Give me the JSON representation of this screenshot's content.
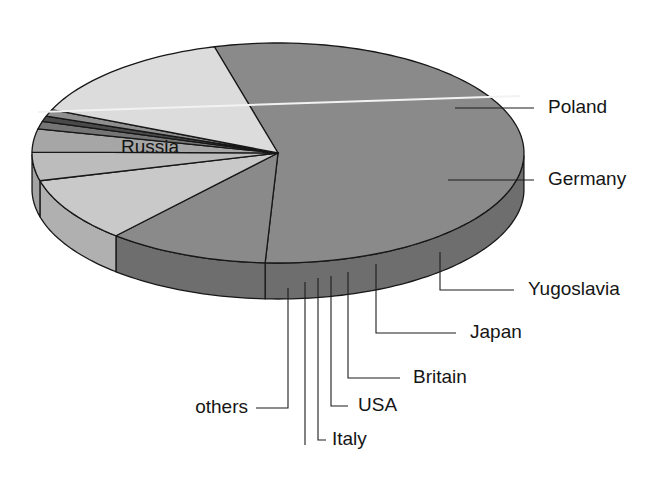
{
  "chart_data": {
    "type": "pie",
    "title": "",
    "subtitle": "",
    "xlabel": "",
    "ylabel": "",
    "legend_position": "callout-labels",
    "grid": false,
    "style": "3d-exploded-none",
    "categories": [
      "Russia",
      "Poland",
      "Germany",
      "Yugoslavia",
      "Japan",
      "Britain",
      "USA",
      "Italy",
      "others"
    ],
    "values": [
      55.0,
      10.6,
      9.5,
      4.2,
      3.4,
      1.1,
      0.8,
      1.0,
      4.4
    ],
    "unit": "percent",
    "series": [
      {
        "name": "share",
        "values": [
          55.0,
          10.6,
          9.5,
          4.2,
          3.4,
          1.1,
          0.8,
          1.0,
          4.4
        ]
      }
    ],
    "slices": [
      {
        "label": "Russia",
        "value": 55.0,
        "start_deg": 255.0,
        "end_deg": 453.0,
        "fill": "#8a8a8a",
        "wall": "#6e6e6e",
        "label_kind": "inside",
        "label_x": 150,
        "label_y": 148
      },
      {
        "label": "Poland",
        "value": 10.6,
        "start_deg": 453.0,
        "end_deg": 491.2,
        "fill": "#8a8a8a",
        "wall": "#6e6e6e",
        "label_kind": "callout",
        "label_x": 548,
        "label_y": 108
      },
      {
        "label": "Germany",
        "value": 9.5,
        "start_deg": 491.2,
        "end_deg": 525.4,
        "fill": "#c9c9c9",
        "wall": "#b0b0b0",
        "label_kind": "callout",
        "label_x": 548,
        "label_y": 180
      },
      {
        "label": "Yugoslavia",
        "value": 4.2,
        "start_deg": 525.4,
        "end_deg": 540.5,
        "fill": "#bcbcbc",
        "wall": "#a3a3a3",
        "label_kind": "callout",
        "label_x": 528,
        "label_y": 290
      },
      {
        "label": "Japan",
        "value": 3.4,
        "start_deg": 540.5,
        "end_deg": 552.7,
        "fill": "#a6a6a6",
        "wall": "#8d8d8d",
        "label_kind": "callout",
        "label_x": 470,
        "label_y": 333
      },
      {
        "label": "Britain",
        "value": 1.1,
        "start_deg": 552.7,
        "end_deg": 556.7,
        "fill": "#757575",
        "wall": "#5e5e5e",
        "label_kind": "callout",
        "label_x": 413,
        "label_y": 378
      },
      {
        "label": "USA",
        "value": 0.8,
        "start_deg": 556.7,
        "end_deg": 559.6,
        "fill": "#4a4a4a",
        "wall": "#3a3a3a",
        "label_kind": "callout",
        "label_x": 358,
        "label_y": 406
      },
      {
        "label": "Italy",
        "value": 1.0,
        "start_deg": 559.6,
        "end_deg": 563.2,
        "fill": "#8f8f8f",
        "wall": "#777777",
        "label_kind": "callout",
        "label_x": 322,
        "label_y": 440
      },
      {
        "label": "others",
        "value": 4.4,
        "start_deg": 563.2,
        "end_deg": 615.0,
        "fill": "#dcdcdc",
        "wall": "#c4c4c4",
        "label_kind": "callout",
        "label_x": 188,
        "label_y": 408
      }
    ],
    "annotations": []
  },
  "labels": {
    "russia": "Russia",
    "poland": "Poland",
    "germany": "Germany",
    "yugoslavia": "Yugoslavia",
    "japan": "Japan",
    "britain": "Britain",
    "usa": "USA",
    "italy": "Italy",
    "others": "others"
  },
  "colors": {
    "background": "#ffffff",
    "outline": "#171717",
    "text": "#151515",
    "leader": "#1d1d1d",
    "russia_top": "#8a8a8a",
    "russia_wall": "#6e6e6e",
    "poland_top": "#8a8a8a",
    "germany_top": "#c9c9c9",
    "yugoslavia_top": "#bcbcbc",
    "japan_top": "#a6a6a6",
    "britain_top": "#757575",
    "usa_top": "#4a4a4a",
    "italy_top": "#8f8f8f",
    "others_top": "#dcdcdc"
  },
  "geometry": {
    "center_x": 278,
    "center_y": 153,
    "radius_x": 246,
    "radius_y": 110,
    "depth": 36
  }
}
